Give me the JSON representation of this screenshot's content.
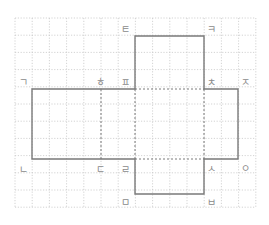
{
  "figure": {
    "grid": {
      "columns": 14,
      "rows": 11
    },
    "labels": [
      {
        "id": "giyeok",
        "text": "ㄱ"
      },
      {
        "id": "nieun",
        "text": "ㄴ"
      },
      {
        "id": "digeut",
        "text": "ㄷ"
      },
      {
        "id": "rieul",
        "text": "ㄹ"
      },
      {
        "id": "mieum",
        "text": "ㅁ"
      },
      {
        "id": "bieup",
        "text": "ㅂ"
      },
      {
        "id": "siot",
        "text": "ㅅ"
      },
      {
        "id": "ieung",
        "text": "ㅇ"
      },
      {
        "id": "jieut",
        "text": "ㅈ"
      },
      {
        "id": "chieut",
        "text": "ㅊ"
      },
      {
        "id": "kieuk",
        "text": "ㅋ"
      },
      {
        "id": "tieut",
        "text": "ㅌ"
      },
      {
        "id": "pieup",
        "text": "ㅍ"
      },
      {
        "id": "hieut",
        "text": "ㅎ"
      }
    ]
  }
}
